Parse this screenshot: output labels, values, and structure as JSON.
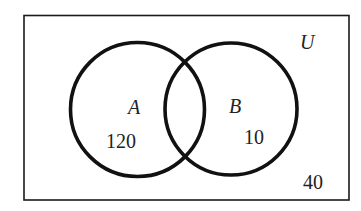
{
  "diagram": {
    "type": "venn",
    "universe": {
      "label": "U",
      "outside_count": "40"
    },
    "sets": [
      {
        "label": "A",
        "only_count": "120"
      },
      {
        "label": "B",
        "only_count": "10"
      }
    ],
    "intersection_count": ""
  },
  "colors": {
    "stroke": "#111111",
    "background": "#ffffff"
  }
}
